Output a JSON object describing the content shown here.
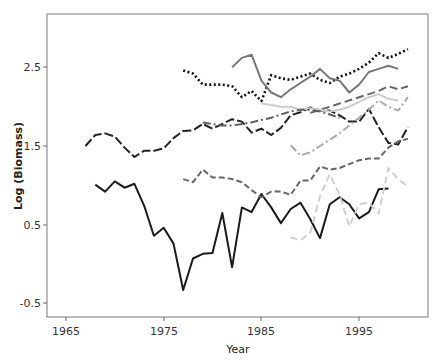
{
  "chart_data": {
    "type": "line",
    "title": "",
    "xlabel": "Year",
    "ylabel": "Log (Biomass)",
    "xlim": [
      1962.9,
      2001.9
    ],
    "ylim": [
      -0.68,
      3.35
    ],
    "xticks": [
      1965,
      1975,
      1985,
      1995
    ],
    "yticks": [
      -0.5,
      0.5,
      1.5,
      2.5
    ],
    "grid": false,
    "legend": null,
    "series": [
      {
        "name": "series-1-black-longdash",
        "color": "#222222",
        "dash": "9,3",
        "width": 2,
        "x": [
          1967,
          1968,
          1969,
          1970,
          1971,
          1972,
          1973,
          1974,
          1975,
          1976,
          1977,
          1978,
          1979,
          1980,
          1981,
          1982,
          1983,
          1984,
          1985,
          1986,
          1987,
          1988,
          1989,
          1990,
          1991,
          1992,
          1993,
          1994,
          1995,
          1996,
          1997,
          1998,
          1999,
          2000
        ],
        "values": [
          1.5,
          1.64,
          1.66,
          1.62,
          1.48,
          1.36,
          1.44,
          1.44,
          1.47,
          1.6,
          1.69,
          1.7,
          1.78,
          1.72,
          1.78,
          1.84,
          1.81,
          1.67,
          1.72,
          1.64,
          1.73,
          1.89,
          1.93,
          1.99,
          1.95,
          1.95,
          1.89,
          1.81,
          1.81,
          1.97,
          1.74,
          1.54,
          1.52,
          1.74
        ]
      },
      {
        "name": "series-2-black-solid",
        "color": "#1a1a1a",
        "dash": "",
        "width": 2,
        "x": [
          1968,
          1969,
          1970,
          1971,
          1972,
          1973,
          1974,
          1975,
          1976,
          1977,
          1978,
          1979,
          1980,
          1981,
          1982,
          1983,
          1984,
          1985,
          1986,
          1987,
          1988,
          1989,
          1990,
          1991,
          1992,
          1993,
          1994,
          1995,
          1996,
          1997,
          1998
        ],
        "values": [
          1.01,
          0.92,
          1.05,
          0.97,
          1.02,
          0.74,
          0.36,
          0.46,
          0.26,
          -0.33,
          0.07,
          0.13,
          0.14,
          0.65,
          -0.04,
          0.72,
          0.66,
          0.89,
          0.72,
          0.52,
          0.7,
          0.78,
          0.57,
          0.33,
          0.76,
          0.85,
          0.76,
          0.58,
          0.66,
          0.95,
          0.96
        ]
      },
      {
        "name": "series-3-black-dotted",
        "color": "#111111",
        "dash": "2,2.5",
        "width": 2.6,
        "x": [
          1977,
          1978,
          1979,
          1980,
          1981,
          1982,
          1983,
          1984,
          1985,
          1986,
          1987,
          1988,
          1989,
          1990,
          1991,
          1992,
          1993,
          1994,
          1995,
          1996,
          1997,
          1998,
          1999,
          2000
        ],
        "values": [
          2.46,
          2.42,
          2.28,
          2.28,
          2.28,
          2.26,
          2.12,
          2.2,
          2.07,
          2.4,
          2.36,
          2.34,
          2.38,
          2.42,
          2.34,
          2.3,
          2.38,
          2.42,
          2.48,
          2.56,
          2.68,
          2.62,
          2.67,
          2.73
        ]
      },
      {
        "name": "series-4-gray-solid",
        "color": "#777777",
        "dash": "",
        "width": 2,
        "x": [
          1982,
          1983,
          1984,
          1985,
          1986,
          1987,
          1988,
          1989,
          1990,
          1991,
          1992,
          1993,
          1994,
          1995,
          1996,
          1997,
          1998,
          1999
        ],
        "values": [
          2.5,
          2.62,
          2.66,
          2.33,
          2.18,
          2.12,
          2.22,
          2.3,
          2.38,
          2.48,
          2.36,
          2.33,
          2.18,
          2.28,
          2.44,
          2.48,
          2.52,
          2.48
        ]
      },
      {
        "name": "series-5-gray-dashed-upper",
        "color": "#666666",
        "dash": "8,4",
        "width": 2,
        "x": [
          1990,
          1991,
          1992,
          1993,
          1994,
          1995,
          1996,
          1997,
          1998,
          1999,
          2000
        ],
        "values": [
          1.92,
          1.96,
          2.0,
          2.04,
          2.08,
          2.12,
          2.16,
          2.2,
          2.26,
          2.22,
          2.26
        ]
      },
      {
        "name": "series-6-lightgray-solid",
        "color": "#cccccc",
        "dash": "",
        "width": 2,
        "x": [
          1985,
          1986,
          1987,
          1988,
          1989,
          1990,
          1991,
          1992,
          1993,
          1994,
          1995,
          1996,
          1997,
          1998,
          1999
        ],
        "values": [
          2.04,
          2.02,
          2.0,
          2.0,
          1.96,
          1.98,
          1.96,
          1.94,
          1.96,
          2.0,
          2.06,
          2.12,
          2.16,
          2.1,
          2.08
        ]
      },
      {
        "name": "series-7-gray-dashdot",
        "color": "#5e5e5e",
        "dash": "8,3,2,3",
        "width": 2,
        "x": [
          1979,
          1980,
          1981,
          1982,
          1983,
          1984,
          1985,
          1986,
          1987,
          1988,
          1989,
          1990,
          1991,
          1992,
          1993
        ],
        "values": [
          1.8,
          1.78,
          1.76,
          1.76,
          1.78,
          1.8,
          1.83,
          1.86,
          1.9,
          1.94,
          1.96,
          1.96,
          1.94,
          1.9,
          1.86
        ]
      },
      {
        "name": "series-8-lightgray-dashdot",
        "color": "#aaaaaa",
        "dash": "8,3,2,3",
        "width": 2,
        "x": [
          1988,
          1989,
          1990,
          1991,
          1992,
          1993,
          1994,
          1995,
          1996,
          1997,
          1998,
          1999,
          2000
        ],
        "values": [
          1.51,
          1.38,
          1.42,
          1.5,
          1.58,
          1.66,
          1.76,
          1.86,
          1.96,
          2.08,
          2.0,
          1.95,
          2.12
        ]
      },
      {
        "name": "series-9-gray-dashed-lower",
        "color": "#666666",
        "dash": "6,3",
        "width": 2,
        "x": [
          1977,
          1978,
          1979,
          1980,
          1981,
          1982,
          1983,
          1984,
          1985,
          1986,
          1987,
          1988,
          1989,
          1990,
          1991,
          1992,
          1993,
          1994,
          1995,
          1996,
          1997,
          1998,
          1999,
          2000
        ],
        "values": [
          1.08,
          1.04,
          1.2,
          1.1,
          1.1,
          1.08,
          1.04,
          0.94,
          0.85,
          0.92,
          0.92,
          0.88,
          1.06,
          1.06,
          1.24,
          1.2,
          1.22,
          1.27,
          1.32,
          1.34,
          1.34,
          1.48,
          1.56,
          1.59
        ]
      },
      {
        "name": "series-10-lightgray-dashed",
        "color": "#cfcfcf",
        "dash": "7,4",
        "width": 2,
        "x": [
          1988,
          1989,
          1990,
          1991,
          1992,
          1993,
          1994,
          1995,
          1996,
          1997,
          1998,
          1999,
          2000
        ],
        "values": [
          0.34,
          0.3,
          0.4,
          0.86,
          1.14,
          0.88,
          0.48,
          0.76,
          0.78,
          0.64,
          1.22,
          1.08,
          0.98
        ]
      }
    ]
  },
  "axes": {
    "xlabel": "Year",
    "ylabel": "Log (Biomass)",
    "xtick_labels": [
      "1965",
      "1975",
      "1985",
      "1995"
    ],
    "ytick_labels": [
      "-0.5",
      "0.5",
      "1.5",
      "2.5"
    ]
  }
}
